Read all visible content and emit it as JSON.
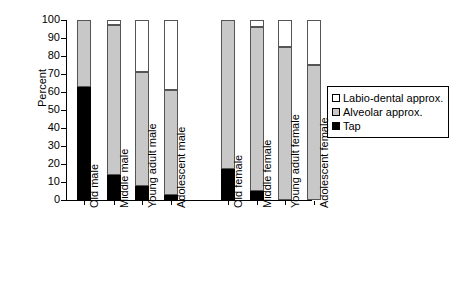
{
  "chart_data": {
    "type": "bar",
    "subtype": "stacked-100-percent",
    "title": "",
    "xlabel": "",
    "ylabel": "Percent",
    "ylim": [
      0,
      100
    ],
    "yticks": [
      0,
      10,
      20,
      30,
      40,
      50,
      60,
      70,
      80,
      90,
      100
    ],
    "grid": false,
    "legend_position": "right",
    "categories": [
      "Old male",
      "Middle male",
      "Young adult male",
      "Adolescent male",
      "Old female",
      "Middle female",
      "Young adult female",
      "Adolescent female"
    ],
    "series": [
      {
        "name": "Tap",
        "color": "#000000",
        "values": [
          63,
          14,
          8,
          3,
          17,
          5,
          0,
          0
        ]
      },
      {
        "name": "Alveolar approx.",
        "color": "#c8c8c8",
        "values": [
          37,
          83,
          63,
          58,
          83,
          91,
          85,
          75
        ]
      },
      {
        "name": "Labio-dental approx.",
        "color": "#ffffff",
        "values": [
          0,
          3,
          29,
          39,
          0,
          4,
          15,
          25
        ]
      }
    ]
  },
  "axis": {
    "ylabel": "Percent",
    "ytick_labels": [
      "100",
      "90",
      "80",
      "70",
      "60",
      "50",
      "40",
      "30",
      "20",
      "10",
      "0"
    ]
  },
  "legend": {
    "items": [
      {
        "label": "Labio-dental approx.",
        "swatch": "white-square-icon"
      },
      {
        "label": "Alveolar approx.",
        "swatch": "gray-square-icon"
      },
      {
        "label": "Tap",
        "swatch": "black-square-icon"
      }
    ]
  }
}
